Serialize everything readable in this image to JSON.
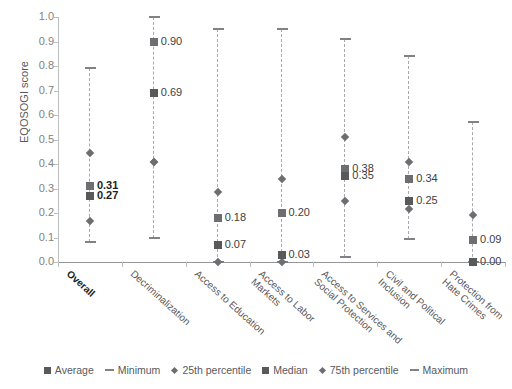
{
  "chart_data": {
    "type": "scatter",
    "title": "",
    "xlabel": "",
    "ylabel": "EQOSOGI score",
    "ylim": [
      0.0,
      1.0
    ],
    "ytick_labels": [
      "0.0",
      "0.1",
      "0.2",
      "0.3",
      "0.4",
      "0.5",
      "0.6",
      "0.7",
      "0.8",
      "0.9",
      "1.0"
    ],
    "ytick_values": [
      0.0,
      0.1,
      0.2,
      0.3,
      0.4,
      0.5,
      0.6,
      0.7,
      0.8,
      0.9,
      1.0
    ],
    "grid": false,
    "legend_position": "bottom",
    "categories": [
      "Overall",
      "Decriminalization",
      "Access to Education",
      "Access to Labor Markets",
      "Access to Services and Social Protection",
      "Civil and Political Inclusion",
      "Protection from Hate Crimes"
    ],
    "category_lines": [
      [
        "Overall"
      ],
      [
        "Decriminalization"
      ],
      [
        "Access to Education"
      ],
      [
        "Access to Labor",
        "Markets"
      ],
      [
        "Access to Services and",
        "Social Protection"
      ],
      [
        "Civil and Political",
        "Inclusion"
      ],
      [
        "Protection from",
        "Hate Crimes"
      ]
    ],
    "series": [
      {
        "name": "Average",
        "values": [
          0.27,
          0.69,
          0.07,
          0.03,
          0.35,
          0.25,
          0.0
        ]
      },
      {
        "name": "Minimum",
        "values": [
          0.08,
          0.1,
          0.0,
          0.0,
          0.02,
          0.095,
          0.0
        ]
      },
      {
        "name": "25th percentile",
        "values": [
          0.167,
          0.41,
          0.0,
          0.0,
          0.25,
          0.215,
          0.0
        ]
      },
      {
        "name": "Median",
        "values": [
          0.31,
          0.9,
          0.18,
          0.2,
          0.38,
          0.34,
          0.09
        ]
      },
      {
        "name": "75th percentile",
        "values": [
          0.445,
          0.41,
          0.285,
          0.34,
          0.51,
          0.41,
          0.19
        ]
      },
      {
        "name": "Maximum",
        "values": [
          0.79,
          1.0,
          0.95,
          0.95,
          0.91,
          0.84,
          0.57
        ]
      }
    ],
    "point_labels": [
      {
        "category": "Overall",
        "series": "Median",
        "text": "0.31",
        "bold": true
      },
      {
        "category": "Overall",
        "series": "Average",
        "text": "0.27",
        "bold": true
      },
      {
        "category": "Decriminalization",
        "series": "Median",
        "text": "0.90",
        "bold": false
      },
      {
        "category": "Decriminalization",
        "series": "Average",
        "text": "0.69",
        "bold": false
      },
      {
        "category": "Access to Education",
        "series": "Median",
        "text": "0.18",
        "bold": false
      },
      {
        "category": "Access to Education",
        "series": "Average",
        "text": "0.07",
        "bold": false
      },
      {
        "category": "Access to Labor Markets",
        "series": "Median",
        "text": "0.20",
        "bold": false
      },
      {
        "category": "Access to Labor Markets",
        "series": "Average",
        "text": "0.03",
        "bold": false
      },
      {
        "category": "Access to Services and Social Protection",
        "series": "Median",
        "text": "0.38",
        "bold": false
      },
      {
        "category": "Access to Services and Social Protection",
        "series": "Average",
        "text": "0.35",
        "bold": false
      },
      {
        "category": "Civil and Political Inclusion",
        "series": "Median",
        "text": "0.34",
        "bold": false
      },
      {
        "category": "Civil and Political Inclusion",
        "series": "Average",
        "text": "0.25",
        "bold": false
      },
      {
        "category": "Protection from Hate Crimes",
        "series": "Median",
        "text": "0.09",
        "bold": false
      },
      {
        "category": "Protection from Hate Crimes",
        "series": "Average",
        "text": "0.00",
        "bold": false
      }
    ]
  },
  "axis": {
    "y_title": "EQOSOGI score"
  },
  "legend": {
    "items": [
      {
        "label": "Average",
        "marker": "square"
      },
      {
        "label": "Minimum",
        "marker": "dash"
      },
      {
        "label": "25th percentile",
        "marker": "diamond"
      },
      {
        "label": "Median",
        "marker": "square"
      },
      {
        "label": "75th percentile",
        "marker": "diamond"
      },
      {
        "label": "Maximum",
        "marker": "dash"
      }
    ]
  },
  "colors": {
    "average": "#58595b",
    "median": "#6d6e71",
    "percentile": "#6d6e71",
    "whisker": "#808285",
    "range_line": "#a7a9ac",
    "axis": "#939598"
  }
}
